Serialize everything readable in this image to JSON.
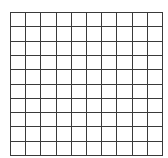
{
  "grid": {
    "rows": 10,
    "cols": 10,
    "line_color": "#3a3a3a",
    "cell_color": "#ffffff"
  }
}
